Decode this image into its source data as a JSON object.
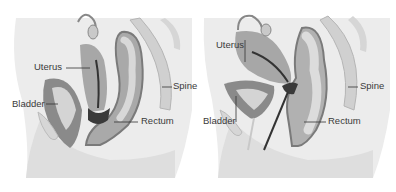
{
  "figure": {
    "panels": [
      {
        "id": "left",
        "labels": {
          "uterus": "Uterus",
          "bladder": "Bladder",
          "spine": "Spine",
          "rectum": "Rectum"
        }
      },
      {
        "id": "right",
        "labels": {
          "uterus": "Uterus",
          "bladder": "Bladder",
          "spine": "Spine",
          "rectum": "Rectum"
        }
      }
    ],
    "colors": {
      "background": "#ffffff",
      "body": "#e6e6e6",
      "body_dark": "#d2d2d2",
      "organ": "#a8a8a8",
      "organ_dark": "#6e6e6e",
      "organ_light": "#cfcfcf",
      "line": "#333333"
    }
  }
}
